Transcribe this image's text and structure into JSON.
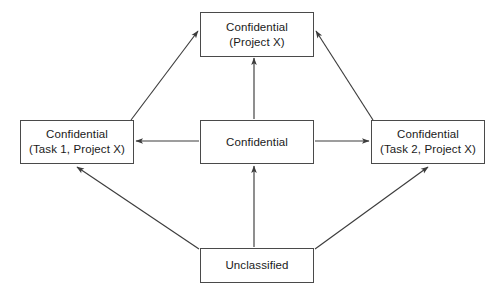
{
  "diagram": {
    "colors": {
      "box_border": "#4a4a4a",
      "text": "#1a1a1a",
      "edge": "#3c3c3c",
      "background": "#ffffff"
    },
    "nodes": [
      {
        "id": "top",
        "line1": "Confidential",
        "line2": "(Project X)",
        "x": 200,
        "y": 12,
        "w": 114,
        "h": 45
      },
      {
        "id": "left",
        "line1": "Confidential",
        "line2": "(Task 1, Project X)",
        "x": 20,
        "y": 120,
        "w": 114,
        "h": 44
      },
      {
        "id": "center",
        "line1": "Confidential",
        "line2": "",
        "x": 200,
        "y": 120,
        "w": 114,
        "h": 44
      },
      {
        "id": "right",
        "line1": "Confidential",
        "line2": "(Task 2, Project X)",
        "x": 371,
        "y": 120,
        "w": 114,
        "h": 44
      },
      {
        "id": "bottom",
        "line1": "Unclassified",
        "line2": "",
        "x": 200,
        "y": 248,
        "w": 114,
        "h": 35
      }
    ],
    "edges": [
      {
        "id": "left-to-top",
        "from": "left",
        "to": "top",
        "x1": 131,
        "y1": 120,
        "x2": 198,
        "y2": 31,
        "label": ""
      },
      {
        "id": "right-to-top",
        "from": "right",
        "to": "top",
        "x1": 373,
        "y1": 120,
        "x2": 316,
        "y2": 31,
        "label": ""
      },
      {
        "id": "center-to-top",
        "from": "center",
        "to": "top",
        "x1": 254,
        "y1": 119,
        "x2": 254,
        "y2": 58,
        "label": ""
      },
      {
        "id": "center-to-left",
        "from": "center",
        "to": "left",
        "x1": 199,
        "y1": 141,
        "x2": 136,
        "y2": 141,
        "label": ""
      },
      {
        "id": "center-to-right",
        "from": "center",
        "to": "right",
        "x1": 315,
        "y1": 141,
        "x2": 369,
        "y2": 141,
        "label": ""
      },
      {
        "id": "bottom-to-left",
        "from": "bottom",
        "to": "left",
        "x1": 199,
        "y1": 249,
        "x2": 77,
        "y2": 167,
        "label": ""
      },
      {
        "id": "bottom-to-right",
        "from": "bottom",
        "to": "right",
        "x1": 315,
        "y1": 249,
        "x2": 428,
        "y2": 167,
        "label": ""
      },
      {
        "id": "bottom-to-center",
        "from": "bottom",
        "to": "center",
        "x1": 254,
        "y1": 247,
        "x2": 254,
        "y2": 166,
        "label": ""
      }
    ]
  }
}
